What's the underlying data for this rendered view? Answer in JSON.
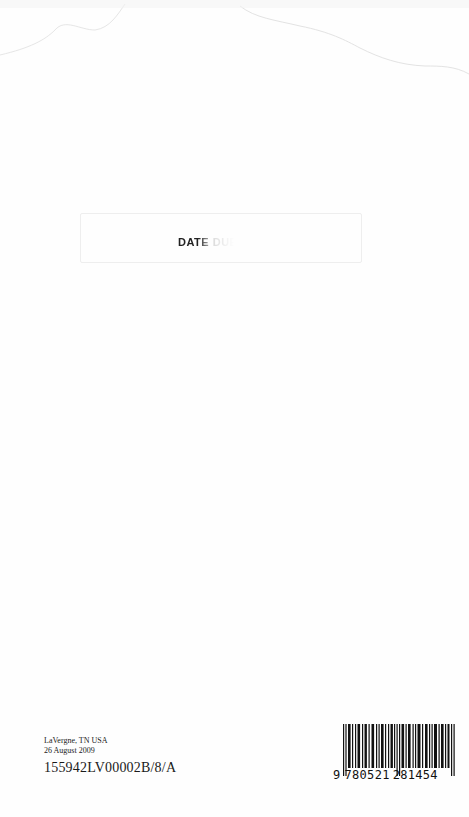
{
  "page": {
    "background": "#fefefe"
  },
  "stamp": {
    "text": "DATE DUE",
    "visible_fragment": "DAT"
  },
  "imprint": {
    "location": "LaVergne, TN USA",
    "date": "26 August 2009",
    "print_code": "155942LV00002B/8/A"
  },
  "barcode": {
    "type": "ISBN / EAN-13",
    "lead_digit": "9",
    "left_group": "780521",
    "right_group": "281454",
    "full": "9780521281454"
  }
}
